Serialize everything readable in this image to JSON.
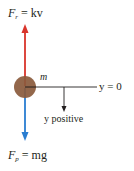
{
  "figure": {
    "colors": {
      "resistance_arrow": "#d9342b",
      "gravity_arrow": "#2a7dd1",
      "mass": "#8a5a3c",
      "axis": "#231f20",
      "text": "#231f20"
    },
    "labels": {
      "resistance_force": {
        "symbol": "F",
        "subscript": "r",
        "rhs": "= kv"
      },
      "gravity_force": {
        "symbol": "F",
        "subscript": "p",
        "rhs": "= mg"
      },
      "mass": "m",
      "origin": "y = 0",
      "direction": "y positive"
    }
  }
}
